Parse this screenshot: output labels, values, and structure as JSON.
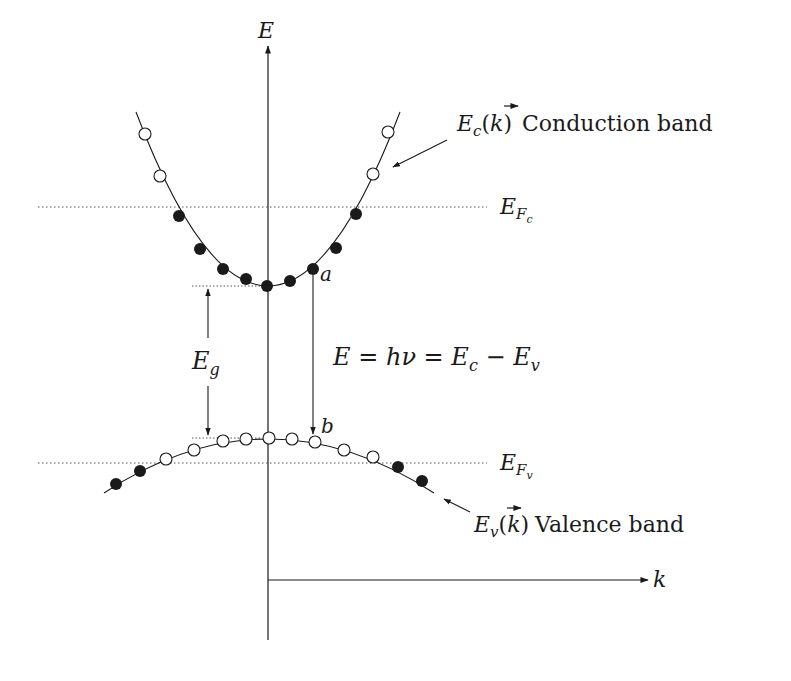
{
  "diagram": {
    "axes": {
      "y_label": "E",
      "x_label": "k"
    },
    "labels": {
      "conduction": {
        "symbol": "E",
        "subscript": "c",
        "arg": "(k⃗)",
        "arg_k": "k",
        "open": "(",
        "close": ")",
        "text": "Conduction band"
      },
      "valence": {
        "symbol": "E",
        "subscript": "v",
        "open": "(",
        "close": ")",
        "arg_k": "k",
        "text": "Valence band"
      },
      "fermi_c": {
        "symbol": "E",
        "subscript": "F",
        "subsub": "c"
      },
      "fermi_v": {
        "symbol": "E",
        "subscript": "F",
        "subsub": "v"
      },
      "gap": {
        "symbol": "E",
        "subscript": "g"
      },
      "equation": {
        "E": "E",
        "eq1": " = ",
        "h": "h",
        "nu": "ν",
        "eq2": " = ",
        "Ec": "E",
        "c": "c",
        "minus": " − ",
        "Ev": "E",
        "v": "v"
      },
      "point_a": "a",
      "point_b": "b"
    },
    "colors": {
      "ink": "#1a1a1a",
      "dotted": "#555555"
    },
    "conduction_points": {
      "filled": [
        [
          179,
          216
        ],
        [
          200,
          249
        ],
        [
          223,
          269
        ],
        [
          246,
          279
        ],
        [
          267,
          286
        ],
        [
          290,
          281
        ],
        [
          313,
          269
        ],
        [
          336,
          248
        ],
        [
          356,
          214
        ]
      ],
      "hollow": [
        [
          145,
          134
        ],
        [
          160,
          176
        ],
        [
          373,
          174
        ],
        [
          388,
          132
        ]
      ]
    },
    "valence_points": {
      "filled": [
        [
          116,
          484
        ],
        [
          140,
          471
        ],
        [
          398,
          467
        ],
        [
          422,
          481
        ]
      ],
      "hollow": [
        [
          166,
          459
        ],
        [
          194,
          450
        ],
        [
          223,
          440
        ],
        [
          246,
          439
        ],
        [
          270,
          439
        ],
        [
          292,
          439
        ],
        [
          316,
          442
        ],
        [
          344,
          451
        ],
        [
          373,
          457
        ]
      ]
    }
  }
}
